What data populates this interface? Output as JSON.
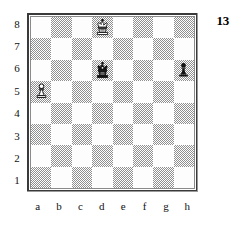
{
  "diagram": {
    "number": "13",
    "rank_labels": [
      "8",
      "7",
      "6",
      "5",
      "4",
      "3",
      "2",
      "1"
    ],
    "file_labels": [
      "a",
      "b",
      "c",
      "d",
      "e",
      "f",
      "g",
      "h"
    ],
    "colors": {
      "light_square": "#fdfdfd",
      "dark_square": "#8f8f8f",
      "border": "#3a3a3a",
      "text": "#111111",
      "piece_black": "#111111",
      "piece_white_outline": "#111111"
    },
    "board": {
      "squares": [
        [
          {
            "square": "a8",
            "shade": "light",
            "piece": null
          },
          {
            "square": "b8",
            "shade": "dark",
            "piece": null
          },
          {
            "square": "c8",
            "shade": "light",
            "piece": null
          },
          {
            "square": "d8",
            "shade": "dark",
            "piece": "white-king"
          },
          {
            "square": "e8",
            "shade": "light",
            "piece": null
          },
          {
            "square": "f8",
            "shade": "dark",
            "piece": null
          },
          {
            "square": "g8",
            "shade": "light",
            "piece": null
          },
          {
            "square": "h8",
            "shade": "dark",
            "piece": null
          }
        ],
        [
          {
            "square": "a7",
            "shade": "dark",
            "piece": null
          },
          {
            "square": "b7",
            "shade": "light",
            "piece": null
          },
          {
            "square": "c7",
            "shade": "dark",
            "piece": null
          },
          {
            "square": "d7",
            "shade": "light",
            "piece": null
          },
          {
            "square": "e7",
            "shade": "dark",
            "piece": null
          },
          {
            "square": "f7",
            "shade": "light",
            "piece": null
          },
          {
            "square": "g7",
            "shade": "dark",
            "piece": null
          },
          {
            "square": "h7",
            "shade": "light",
            "piece": null
          }
        ],
        [
          {
            "square": "a6",
            "shade": "light",
            "piece": null
          },
          {
            "square": "b6",
            "shade": "dark",
            "piece": null
          },
          {
            "square": "c6",
            "shade": "light",
            "piece": null
          },
          {
            "square": "d6",
            "shade": "dark",
            "piece": "black-king"
          },
          {
            "square": "e6",
            "shade": "light",
            "piece": null
          },
          {
            "square": "f6",
            "shade": "dark",
            "piece": null
          },
          {
            "square": "g6",
            "shade": "light",
            "piece": null
          },
          {
            "square": "h6",
            "shade": "dark",
            "piece": "black-pawn"
          }
        ],
        [
          {
            "square": "a5",
            "shade": "dark",
            "piece": "white-pawn"
          },
          {
            "square": "b5",
            "shade": "light",
            "piece": null
          },
          {
            "square": "c5",
            "shade": "dark",
            "piece": null
          },
          {
            "square": "d5",
            "shade": "light",
            "piece": null
          },
          {
            "square": "e5",
            "shade": "dark",
            "piece": null
          },
          {
            "square": "f5",
            "shade": "light",
            "piece": null
          },
          {
            "square": "g5",
            "shade": "dark",
            "piece": null
          },
          {
            "square": "h5",
            "shade": "light",
            "piece": null
          }
        ],
        [
          {
            "square": "a4",
            "shade": "light",
            "piece": null
          },
          {
            "square": "b4",
            "shade": "dark",
            "piece": null
          },
          {
            "square": "c4",
            "shade": "light",
            "piece": null
          },
          {
            "square": "d4",
            "shade": "dark",
            "piece": null
          },
          {
            "square": "e4",
            "shade": "light",
            "piece": null
          },
          {
            "square": "f4",
            "shade": "dark",
            "piece": null
          },
          {
            "square": "g4",
            "shade": "light",
            "piece": null
          },
          {
            "square": "h4",
            "shade": "dark",
            "piece": null
          }
        ],
        [
          {
            "square": "a3",
            "shade": "dark",
            "piece": null
          },
          {
            "square": "b3",
            "shade": "light",
            "piece": null
          },
          {
            "square": "c3",
            "shade": "dark",
            "piece": null
          },
          {
            "square": "d3",
            "shade": "light",
            "piece": null
          },
          {
            "square": "e3",
            "shade": "dark",
            "piece": null
          },
          {
            "square": "f3",
            "shade": "light",
            "piece": null
          },
          {
            "square": "g3",
            "shade": "dark",
            "piece": null
          },
          {
            "square": "h3",
            "shade": "light",
            "piece": null
          }
        ],
        [
          {
            "square": "a2",
            "shade": "light",
            "piece": null
          },
          {
            "square": "b2",
            "shade": "dark",
            "piece": null
          },
          {
            "square": "c2",
            "shade": "light",
            "piece": null
          },
          {
            "square": "d2",
            "shade": "dark",
            "piece": null
          },
          {
            "square": "e2",
            "shade": "light",
            "piece": null
          },
          {
            "square": "f2",
            "shade": "dark",
            "piece": null
          },
          {
            "square": "g2",
            "shade": "light",
            "piece": null
          },
          {
            "square": "h2",
            "shade": "dark",
            "piece": null
          }
        ],
        [
          {
            "square": "a1",
            "shade": "dark",
            "piece": null
          },
          {
            "square": "b1",
            "shade": "light",
            "piece": null
          },
          {
            "square": "c1",
            "shade": "dark",
            "piece": null
          },
          {
            "square": "d1",
            "shade": "light",
            "piece": null
          },
          {
            "square": "e1",
            "shade": "dark",
            "piece": null
          },
          {
            "square": "f1",
            "shade": "light",
            "piece": null
          },
          {
            "square": "g1",
            "shade": "dark",
            "piece": null
          },
          {
            "square": "h1",
            "shade": "light",
            "piece": null
          }
        ]
      ]
    },
    "pieces_on_board": [
      {
        "piece": "white-king",
        "square": "d8"
      },
      {
        "piece": "black-king",
        "square": "d6"
      },
      {
        "piece": "white-pawn",
        "square": "a5"
      },
      {
        "piece": "black-pawn",
        "square": "h6"
      }
    ]
  }
}
